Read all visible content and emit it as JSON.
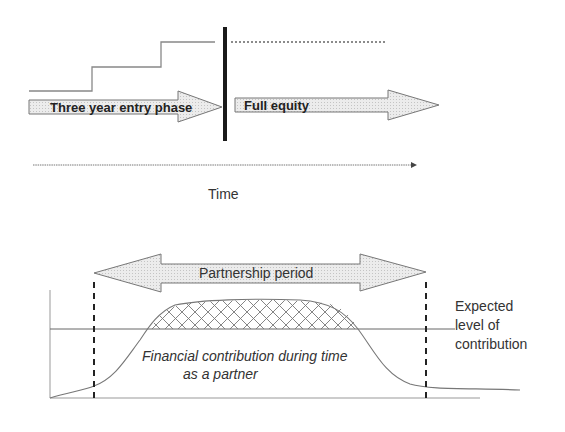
{
  "top_diagram": {
    "entry_phase_label": "Three year entry phase",
    "full_equity_label": "Full equity",
    "time_axis_label": "Time",
    "stair_steps": 3
  },
  "bottom_diagram": {
    "partnership_label": "Partnership period",
    "curve_label_line1": "Financial contribution during time",
    "curve_label_line2": "as a partner",
    "expected_label_line1": "Expected",
    "expected_label_line2": "level of",
    "expected_label_line3": "contribution"
  },
  "colors": {
    "line": "#888888",
    "dark_bar": "#1a1a1a",
    "arrow_fill": "#e6e6e6",
    "arrow_stroke": "#777777",
    "text": "#333333"
  }
}
